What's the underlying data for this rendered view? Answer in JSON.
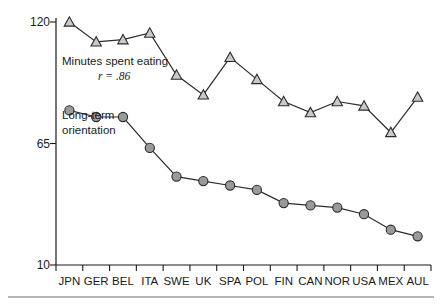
{
  "chart_data": {
    "type": "line",
    "title": "",
    "subtitle": "",
    "xlabel": "",
    "ylabel": "",
    "ylim": [
      10,
      120
    ],
    "yticks": [
      10,
      65,
      120
    ],
    "ytick_labels": [
      "10",
      "65",
      "120"
    ],
    "grid": false,
    "legend_position": "inline-annotation",
    "categories": [
      "JPN",
      "GER",
      "BEL",
      "ITA",
      "SWE",
      "UK",
      "SPA",
      "POL",
      "FIN",
      "CAN",
      "NOR",
      "USA",
      "MEX",
      "AUL"
    ],
    "series": [
      {
        "name": "Minutes spent eating",
        "marker": "triangle",
        "marker_fill": "#c9c9c9",
        "line_color": "#2b2b2b",
        "annotation": "r = .86",
        "values": [
          120,
          111,
          112,
          115,
          96,
          87,
          104,
          94,
          84,
          79,
          84,
          82,
          70,
          86
        ]
      },
      {
        "name": "Long-term orientation",
        "marker": "circle",
        "marker_fill": "#9a9a9a",
        "line_color": "#2b2b2b",
        "annotation": "",
        "values": [
          80,
          77,
          77,
          63,
          50,
          48,
          46,
          44,
          38,
          37,
          36,
          33,
          26,
          23
        ]
      }
    ],
    "annotations": [
      {
        "id": "minutes-label",
        "text": "Minutes spent eating",
        "x": 0.9,
        "y": 101
      },
      {
        "id": "r-value",
        "text": "r = .86",
        "x": 2.0,
        "y": 94
      },
      {
        "id": "orientation-label-line1",
        "text": "Long-term",
        "x": 0.6,
        "y": 76
      },
      {
        "id": "orientation-label-line2",
        "text": "orientation",
        "x": 0.6,
        "y": 69
      }
    ]
  },
  "axes": {
    "y_top_label": "120",
    "y_mid_label": "65",
    "y_bottom_label": "10"
  },
  "labels": {
    "minutes_spent_eating": "Minutes spent eating",
    "r_value": "r = .86",
    "long_term_line1": "Long-term",
    "long_term_line2": "orientation"
  },
  "colors": {
    "axis": "#1a1a1a",
    "line": "#2b2b2b",
    "circle_fill": "#9a9a9a",
    "triangle_fill": "#c9c9c9",
    "footer_rule": "#6f6f6f"
  }
}
